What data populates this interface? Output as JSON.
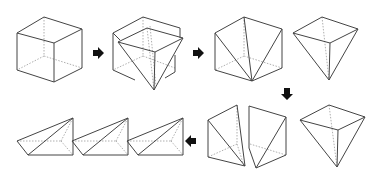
{
  "diagram": {
    "colors": {
      "edge": "#444444",
      "hidden_edge": "#9a9a9a",
      "arrow": "#111111",
      "background": "#ffffff"
    },
    "steps": [
      {
        "id": "cube",
        "label": ""
      },
      {
        "id": "cube-with-inverted-pyramid",
        "label": ""
      },
      {
        "id": "cube-cut-diagonals",
        "label": ""
      },
      {
        "id": "inverted-pyramid-removed",
        "label": ""
      },
      {
        "id": "split-halves",
        "label": ""
      },
      {
        "id": "inverted-pyramid",
        "label": ""
      },
      {
        "id": "pyramid-1",
        "label": ""
      },
      {
        "id": "pyramid-2",
        "label": ""
      },
      {
        "id": "pyramid-3",
        "label": ""
      }
    ],
    "arrows": [
      {
        "id": "arrow-right-1",
        "direction": "right"
      },
      {
        "id": "arrow-right-2",
        "direction": "right"
      },
      {
        "id": "arrow-down",
        "direction": "down"
      },
      {
        "id": "arrow-left",
        "direction": "left"
      }
    ]
  }
}
